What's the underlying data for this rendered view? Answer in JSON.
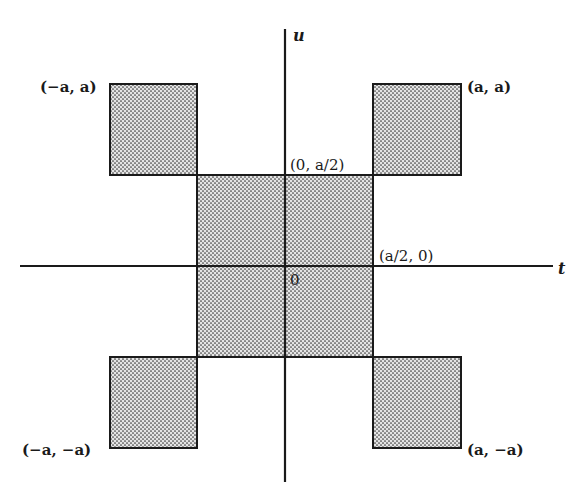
{
  "figure": {
    "type": "diagram",
    "axes": {
      "horizontal": {
        "name": "t"
      },
      "vertical": {
        "name": "u"
      }
    },
    "origin_label": "0",
    "colors": {
      "stroke": "#1a1a1a",
      "fill": "#d6d6d6",
      "dot": "#3a3a3a",
      "background": "#ffffff"
    },
    "corner_labels": {
      "top_left": "(−a, a)",
      "top_right": "(a, a)",
      "bottom_left": "(−a, −a)",
      "bottom_right": "(a, −a)",
      "center_top": "(0, a/2)",
      "center_right": "(a/2, 0)"
    },
    "regions": [
      {
        "name": "top-left-square",
        "t_range": [
          "-a",
          "-a/2"
        ],
        "u_range": [
          "a/2",
          "a"
        ]
      },
      {
        "name": "top-right-square",
        "t_range": [
          "a/2",
          "a"
        ],
        "u_range": [
          "a/2",
          "a"
        ]
      },
      {
        "name": "center-square",
        "t_range": [
          "-a/2",
          "a/2"
        ],
        "u_range": [
          "-a/2",
          "a/2"
        ]
      },
      {
        "name": "bottom-left-square",
        "t_range": [
          "-a",
          "-a/2"
        ],
        "u_range": [
          "-a",
          "-a/2"
        ]
      },
      {
        "name": "bottom-right-square",
        "t_range": [
          "a/2",
          "a"
        ],
        "u_range": [
          "-a",
          "-a/2"
        ]
      }
    ]
  }
}
